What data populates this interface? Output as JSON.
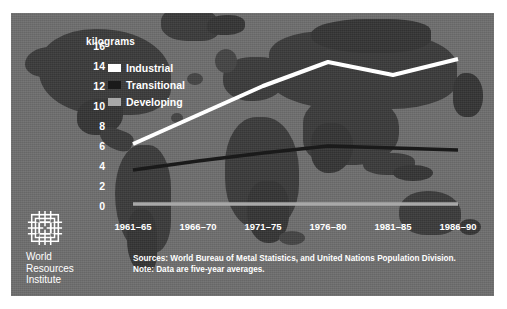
{
  "figure": {
    "background_color": "#6e6e6e",
    "page_color": "#ffffff"
  },
  "legend": {
    "position": "upper-left-inside",
    "items": [
      {
        "label": "Industrial",
        "color": "#ffffff",
        "swatch_name": "legend-swatch-industrial"
      },
      {
        "label": "Transitional",
        "color": "#1a1a1a",
        "swatch_name": "legend-swatch-transitional"
      },
      {
        "label": "Developing",
        "color": "#a8a8a8",
        "swatch_name": "legend-swatch-developing"
      }
    ]
  },
  "notes": {
    "sources": "Sources: World Bureau of Metal Statistics, and United Nations Population Division.",
    "note": "Note: Data are five-year averages."
  },
  "logo": {
    "line1": "World",
    "line2": "Resources",
    "line3": "Institute",
    "mark_name": "wri-woven-square-logo"
  },
  "chart_data": {
    "type": "line",
    "title": "",
    "subtitle": "",
    "xlabel": "",
    "ylabel": "kilograms",
    "ylim": [
      0,
      16
    ],
    "yticks": [
      0,
      2,
      4,
      6,
      8,
      10,
      12,
      14,
      16
    ],
    "ytick_labels": [
      "0",
      "2",
      "4",
      "6",
      "8",
      "10",
      "12",
      "14",
      "16"
    ],
    "grid": false,
    "legend_position": "upper left",
    "categories": [
      "1961–65",
      "1966–70",
      "1971–75",
      "1976–80",
      "1981–85",
      "1986–90"
    ],
    "series": [
      {
        "name": "Industrial",
        "color": "#ffffff",
        "width": 4.0,
        "values": [
          6.3,
          9.2,
          12.1,
          14.5,
          13.2,
          14.8
        ]
      },
      {
        "name": "Transitional",
        "color": "#1a1a1a",
        "width": 3.4,
        "values": [
          3.7,
          4.6,
          5.4,
          6.1,
          5.9,
          5.7
        ]
      },
      {
        "name": "Developing",
        "color": "#a8a8a8",
        "width": 3.4,
        "values": [
          0.3,
          0.3,
          0.3,
          0.3,
          0.3,
          0.3
        ]
      }
    ]
  }
}
